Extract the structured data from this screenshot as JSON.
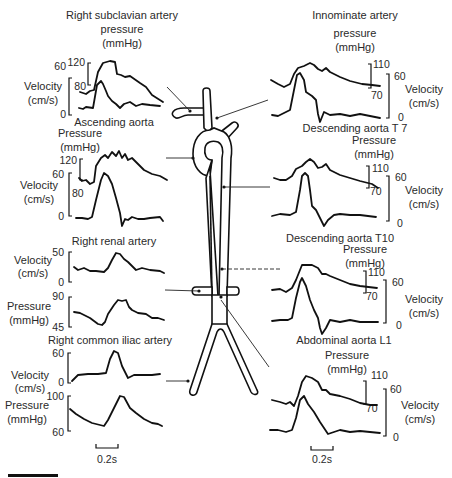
{
  "figure": {
    "type": "anatomical waveform diagram",
    "center_illustration": "aorta-and-branches",
    "time_scale_label": "0.2s",
    "scale_bar": "black-bar-bottom-left"
  },
  "panels": {
    "right_subclavian": {
      "title_lines": [
        "Right subclavian artery",
        "pressure",
        "(mmHg)"
      ],
      "velocity_label": [
        "Velocity",
        "(cm/s)"
      ],
      "pressure_ticks": [
        "120",
        "80"
      ],
      "velocity_ticks": [
        "60",
        "0"
      ]
    },
    "ascending_aorta": {
      "title": "Ascending aorta",
      "pressure_label": [
        "Pressure",
        "(mmHg)"
      ],
      "velocity_label": [
        "Velocity",
        "(cm/s)"
      ],
      "pressure_ticks": [
        "120",
        "80"
      ],
      "velocity_ticks": [
        "60",
        "0"
      ]
    },
    "right_renal": {
      "title": "Right renal artery",
      "velocity_label": [
        "Velocity",
        "(cm/s)"
      ],
      "velocity_ticks": [
        "50",
        "0"
      ],
      "pressure_label": [
        "Pressure",
        "(mmHg)"
      ],
      "pressure_ticks": [
        "90",
        "45"
      ]
    },
    "right_common_iliac": {
      "title": "Right common iliac artery",
      "velocity_label": [
        "Velocity",
        "(cm/s)"
      ],
      "velocity_ticks": [
        "60",
        "0"
      ],
      "pressure_label": [
        "Pressure",
        "(mmHg)"
      ],
      "pressure_ticks": [
        "100",
        "60"
      ],
      "time_scale": "0.2s"
    },
    "innominate": {
      "title_lines": [
        "Innominate artery",
        "pressure",
        "(mmHg)"
      ],
      "velocity_label": [
        "Velocity",
        "(cm/s)"
      ],
      "pressure_ticks": [
        "110",
        "70"
      ],
      "velocity_ticks": [
        "60",
        "0"
      ]
    },
    "descending_t7": {
      "title": "Descending aorta T 7",
      "pressure_label": [
        "Pressure",
        "(mmHg)"
      ],
      "velocity_label": [
        "Velocity",
        "(cm/s)"
      ],
      "pressure_ticks": [
        "110",
        "70"
      ],
      "velocity_ticks": [
        "60",
        "0"
      ]
    },
    "descending_t10": {
      "title": "Descending aorta T10",
      "pressure_label": [
        "Pressure",
        "(mmHg)"
      ],
      "velocity_label": [
        "Velocity",
        "(cm/s)"
      ],
      "pressure_ticks": [
        "110",
        "70"
      ],
      "velocity_ticks": [
        "60",
        "0"
      ]
    },
    "abdominal_l1": {
      "title": "Abdominal aorta L1",
      "pressure_label": [
        "Pressure",
        "(mmHg)"
      ],
      "velocity_label": [
        "Velocity",
        "(cm/s)"
      ],
      "pressure_ticks": [
        "110",
        "70"
      ],
      "velocity_ticks": [
        "60",
        "0"
      ],
      "time_scale": "0.2s"
    }
  },
  "colors": {
    "ink": "#111111",
    "text": "#2a2a2a",
    "background": "#ffffff"
  }
}
